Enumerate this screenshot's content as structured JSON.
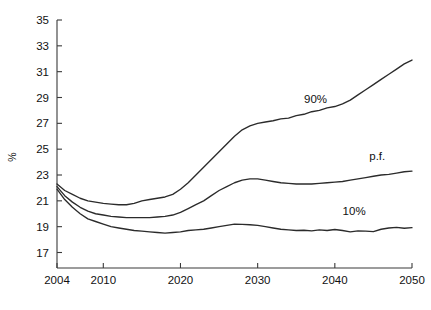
{
  "chart_data": {
    "type": "line",
    "title": "",
    "xlabel": "",
    "ylabel": "%",
    "xlim": [
      2004,
      2050
    ],
    "ylim": [
      15.8,
      35
    ],
    "xticks": [
      2004,
      2010,
      2020,
      2030,
      2040,
      2050
    ],
    "yticks": [
      17,
      19,
      21,
      23,
      25,
      27,
      29,
      31,
      33,
      35
    ],
    "xtick_labels": [
      "2004",
      "2010",
      "2020",
      "2030",
      "2040",
      "2050"
    ],
    "ytick_labels": [
      "17",
      "19",
      "21",
      "23",
      "25",
      "27",
      "29",
      "31",
      "33",
      "35"
    ],
    "grid": false,
    "legend_position": "inline-annotations",
    "line_color": "#2b2b2b",
    "x": [
      2004,
      2005,
      2006,
      2007,
      2008,
      2009,
      2010,
      2011,
      2012,
      2013,
      2014,
      2015,
      2016,
      2017,
      2018,
      2019,
      2020,
      2021,
      2022,
      2023,
      2024,
      2025,
      2026,
      2027,
      2028,
      2029,
      2030,
      2031,
      2032,
      2033,
      2034,
      2035,
      2036,
      2037,
      2038,
      2039,
      2040,
      2041,
      2042,
      2043,
      2044,
      2045,
      2046,
      2047,
      2048,
      2049,
      2050
    ],
    "series": [
      {
        "name": "90%",
        "label": "90%",
        "label_x": 2037.5,
        "label_y": 28.6,
        "values": [
          22.3,
          21.8,
          21.5,
          21.2,
          21.0,
          20.9,
          20.8,
          20.75,
          20.7,
          20.7,
          20.8,
          21.0,
          21.1,
          21.2,
          21.3,
          21.5,
          21.9,
          22.4,
          23.0,
          23.6,
          24.2,
          24.8,
          25.4,
          26.0,
          26.5,
          26.8,
          27.0,
          27.1,
          27.2,
          27.35,
          27.4,
          27.6,
          27.7,
          27.9,
          28.0,
          28.2,
          28.3,
          28.5,
          28.8,
          29.2,
          29.6,
          30.0,
          30.4,
          30.8,
          31.2,
          31.6,
          31.9
        ]
      },
      {
        "name": "p.f.",
        "label": "p.f.",
        "label_x": 2045.5,
        "label_y": 24.2,
        "values": [
          22.1,
          21.4,
          20.9,
          20.5,
          20.2,
          20.0,
          19.9,
          19.8,
          19.75,
          19.7,
          19.7,
          19.7,
          19.7,
          19.75,
          19.8,
          19.9,
          20.1,
          20.4,
          20.7,
          21.0,
          21.4,
          21.8,
          22.1,
          22.4,
          22.6,
          22.7,
          22.7,
          22.6,
          22.5,
          22.4,
          22.35,
          22.3,
          22.3,
          22.3,
          22.35,
          22.4,
          22.45,
          22.5,
          22.6,
          22.7,
          22.8,
          22.9,
          23.0,
          23.05,
          23.15,
          23.25,
          23.3
        ]
      },
      {
        "name": "10%",
        "label": "10%",
        "label_x": 2042.5,
        "label_y": 19.9,
        "values": [
          21.9,
          21.1,
          20.5,
          20.0,
          19.6,
          19.4,
          19.2,
          19.0,
          18.9,
          18.8,
          18.7,
          18.65,
          18.6,
          18.55,
          18.5,
          18.55,
          18.6,
          18.7,
          18.75,
          18.8,
          18.9,
          19.0,
          19.1,
          19.2,
          19.18,
          19.15,
          19.1,
          19.0,
          18.9,
          18.8,
          18.75,
          18.7,
          18.72,
          18.68,
          18.75,
          18.7,
          18.78,
          18.7,
          18.6,
          18.68,
          18.65,
          18.62,
          18.8,
          18.9,
          18.95,
          18.88,
          18.92
        ]
      }
    ]
  }
}
